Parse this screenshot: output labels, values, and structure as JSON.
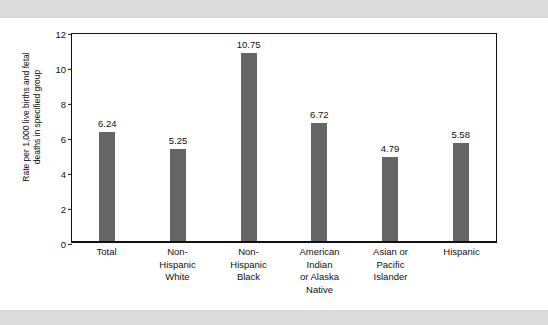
{
  "chart_data": {
    "type": "bar",
    "title": "",
    "xlabel": "",
    "ylabel": "Rate per 1,000 live births and fetal\ndeaths in specified group",
    "categories": [
      "Total",
      "Non-\nHispanic\nWhite",
      "Non-\nHispanic\nBlack",
      "American\nIndian\nor Alaska\nNative",
      "Asian or\nPacific\nIslander",
      "Hispanic"
    ],
    "values": [
      6.24,
      5.25,
      10.75,
      6.72,
      4.79,
      5.58
    ],
    "value_labels": [
      "6.24",
      "5.25",
      "10.75",
      "6.72",
      "4.79",
      "5.58"
    ],
    "ylim": [
      0,
      12
    ],
    "yticks": [
      0,
      2,
      4,
      6,
      8,
      10,
      12
    ],
    "ytick_labels": [
      "0",
      "2",
      "4",
      "6",
      "8",
      "10",
      "12"
    ],
    "grid": false,
    "legend": false,
    "bar_color": "#656565",
    "frame_color": "#111111",
    "background": "#ffffff",
    "band_color": "#dcdcdc"
  }
}
